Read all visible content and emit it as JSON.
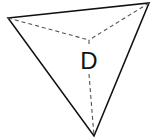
{
  "diagram": {
    "type": "triangular-pyramid-top-view",
    "label": "D",
    "vertices": {
      "left": [
        8,
        18
      ],
      "right": [
        149,
        3
      ],
      "bottom": [
        94,
        136
      ],
      "apex": [
        89,
        40
      ]
    },
    "colors": {
      "stroke": "#111111",
      "dashed": "#555555",
      "background": "#ffffff"
    }
  }
}
